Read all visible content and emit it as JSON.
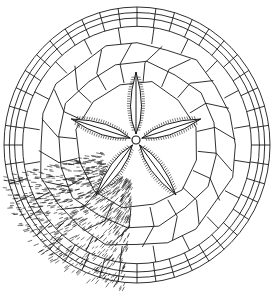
{
  "figure": {
    "view": "aboral surface",
    "background_color": "#ffffff",
    "line_color": "#1a1a1a",
    "center": [
      136,
      140
    ],
    "outline": {
      "cx": 137,
      "cy": 145,
      "rx": 133,
      "ry": 138
    },
    "petal_count": 5,
    "petal_angles_deg": [
      -90,
      -18,
      54,
      126,
      198
    ],
    "spine_region": "lower-left sector covered with hair-like spines"
  }
}
